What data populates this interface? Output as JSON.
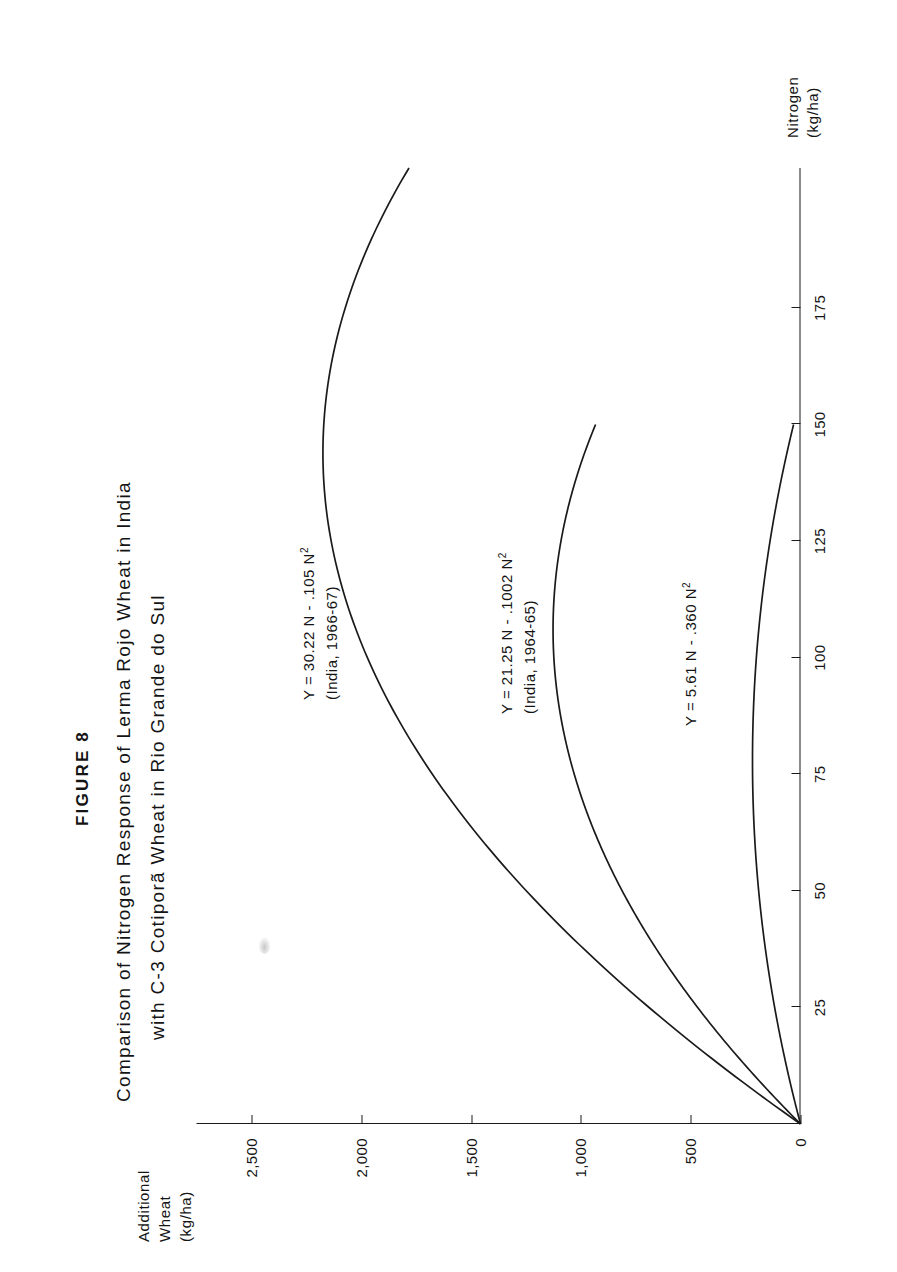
{
  "figure": {
    "number": "FIGURE 8",
    "title_line_1": "Comparison of Nitrogen Response of Lerma Rojo Wheat in India",
    "title_line_2": "with C-3 Cotiporã Wheat in Rio Grande do Sul"
  },
  "axes": {
    "y_title_line_1": "Additional",
    "y_title_line_2": "Wheat",
    "y_title_line_3": "(kg/ha)",
    "x_title_line_1": "Nitrogen",
    "x_title_line_2": "(kg/ha)"
  },
  "annotations": {
    "eq1_line1": "Y = 30.22 N - .105 N",
    "eq1_exp": "2",
    "eq1_line2": "(India, 1966-67)",
    "eq2_line1": "Y = 21.25 N - .1002 N",
    "eq2_exp": "2",
    "eq2_line2": "(India, 1964-65)",
    "eq3_line1": "Y = 5.61 N - .360 N",
    "eq3_exp": "2"
  },
  "chart_data": {
    "type": "line",
    "title": "Comparison of Nitrogen Response of Lerma Rojo Wheat in India with C-3 Cotiporã Wheat in Rio Grande do Sul",
    "xlabel": "Nitrogen (kg/ha)",
    "ylabel": "Additional Wheat (kg/ha)",
    "xlim": [
      0,
      205
    ],
    "ylim": [
      0,
      2750
    ],
    "xticks": [
      25,
      50,
      75,
      100,
      125,
      150,
      175
    ],
    "xticklabels": [
      "25",
      "50",
      "75",
      "100",
      "125",
      "150",
      "175"
    ],
    "yticks": [
      0,
      500,
      1000,
      1500,
      2000,
      2500
    ],
    "yticklabels": [
      "0",
      "500",
      "1,000",
      "1,500",
      "2,000",
      "2,500"
    ],
    "grid": false,
    "legend": "none (curves labelled in-plot)",
    "series": [
      {
        "name": "India, 1966-67",
        "equation": "Y = 30.22 N - .105 N^2",
        "coefficients": {
          "linear": 30.22,
          "quadratic": -0.105
        },
        "x": [
          0,
          25,
          50,
          75,
          100,
          125,
          144,
          150,
          175,
          200,
          205
        ],
        "y": [
          0,
          690,
          1249,
          1676,
          1972,
          2137,
          2173,
          2171,
          2073,
          1844,
          1780
        ]
      },
      {
        "name": "India, 1964-65",
        "equation": "Y = 21.25 N - .1002 N^2",
        "coefficients": {
          "linear": 21.25,
          "quadratic": -0.1002
        },
        "x": [
          0,
          25,
          50,
          75,
          100,
          106,
          125,
          150
        ],
        "y": [
          0,
          469,
          812,
          1030,
          1123,
          1126,
          1091,
          933
        ]
      },
      {
        "name": "Rio Grande do Sul (C-3 Cotiporã)",
        "equation": "Y = 5.61 N - .360 N^2",
        "coefficients": {
          "linear": 5.61,
          "quadratic": -0.036
        },
        "x": [
          0,
          25,
          50,
          75,
          78,
          100,
          125,
          150
        ],
        "y": [
          0,
          118,
          190,
          218,
          219,
          201,
          139,
          32
        ]
      }
    ]
  }
}
